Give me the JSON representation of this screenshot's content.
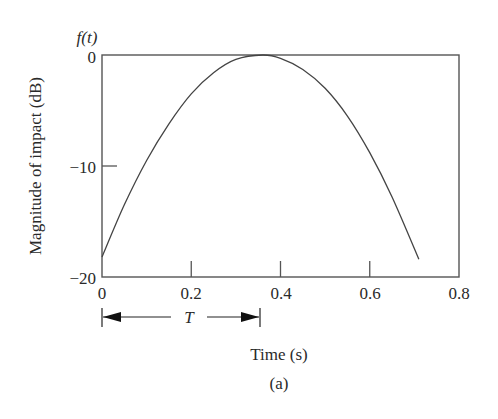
{
  "chart_data": {
    "type": "line",
    "title": "",
    "function_label": "f(t)",
    "xlabel": "Time (s)",
    "ylabel": "Magnitude of impact (dB)",
    "caption": "(a)",
    "xlim": [
      0,
      0.8
    ],
    "ylim": [
      -20,
      0
    ],
    "x_ticks": [
      0,
      0.2,
      0.4,
      0.6,
      0.8
    ],
    "x_tick_labels": [
      "0",
      "0.2",
      "0.4",
      "0.6",
      "0.8"
    ],
    "y_ticks": [
      0,
      -10,
      -20
    ],
    "y_tick_labels": [
      "0",
      "−10",
      "−20"
    ],
    "grid": false,
    "legend": null,
    "series": [
      {
        "name": "f(t)",
        "x": [
          0.0,
          0.05,
          0.1,
          0.15,
          0.2,
          0.25,
          0.3,
          0.36,
          0.4,
          0.45,
          0.5,
          0.55,
          0.6,
          0.65,
          0.71
        ],
        "y": [
          -18.2,
          -13.5,
          -9.5,
          -6.2,
          -3.5,
          -1.6,
          -0.4,
          0.0,
          -0.3,
          -1.3,
          -3.0,
          -5.5,
          -8.8,
          -12.8,
          -18.4
        ]
      }
    ],
    "annotation": {
      "label": "T",
      "from_x": 0,
      "to_x": 0.355,
      "description": "double-headed dimension arrow spanning duration T"
    }
  }
}
